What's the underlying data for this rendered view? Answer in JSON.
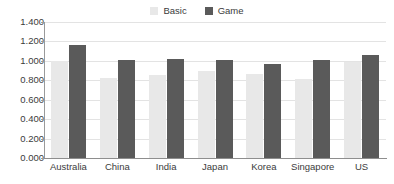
{
  "chart_data": {
    "type": "bar",
    "title": "",
    "subtitle": "",
    "xlabel": "",
    "ylabel": "",
    "categories": [
      "Australia",
      "China",
      "India",
      "Japan",
      "Korea",
      "Singapore",
      "US"
    ],
    "series": [
      {
        "name": "Basic",
        "color": "#e8e8e8",
        "values": [
          1.0,
          0.82,
          0.85,
          0.9,
          0.86,
          0.81,
          0.99
        ]
      },
      {
        "name": "Game",
        "color": "#5a5a5a",
        "values": [
          1.16,
          1.01,
          1.02,
          1.01,
          0.97,
          1.01,
          1.06
        ]
      }
    ],
    "ylim": [
      0.0,
      1.4
    ],
    "ytick_values": [
      1.4,
      1.2,
      1.0,
      0.8,
      0.6,
      0.4,
      0.2,
      0.0
    ],
    "ytick_labels": [
      "1.400",
      "1.200",
      "1.000",
      "0.800",
      "0.600",
      "0.400",
      "0.200",
      "0.000"
    ],
    "grid": true,
    "grid_axis": "y",
    "legend_position": "top-center",
    "annotations": []
  },
  "legend": {
    "entries": [
      {
        "label": "Basic",
        "color": "#e8e8e8",
        "swatch_icon": "square-swatch-icon"
      },
      {
        "label": "Game",
        "color": "#5a5a5a",
        "swatch_icon": "square-swatch-icon"
      }
    ]
  },
  "colors": {
    "background": "#ffffff",
    "gridline": "#e3e3e3",
    "axis": "#8e8e8e",
    "text": "#3b3b3b",
    "series_basic": "#e8e8e8",
    "series_game": "#5a5a5a"
  }
}
